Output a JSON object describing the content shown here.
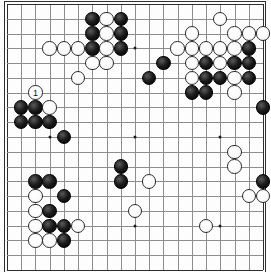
{
  "board": {
    "size": 19,
    "origin_x": 7,
    "origin_y": 4,
    "spacing_x": 14.22,
    "spacing_y": 14.78,
    "stone_radius": 7.2,
    "line_color": "#8d8d8d",
    "edge_color": "#2e2e2e",
    "background_color": "#fdfdfd",
    "black_color": "#000000",
    "white_color": "#ffffff",
    "star_points": [
      [
        4,
        4
      ],
      [
        10,
        4
      ],
      [
        16,
        4
      ],
      [
        4,
        10
      ],
      [
        10,
        10
      ],
      [
        16,
        10
      ],
      [
        4,
        16
      ],
      [
        10,
        16
      ],
      [
        16,
        16
      ]
    ],
    "visible_columns": [
      1,
      19
    ],
    "visible_rows": [
      1,
      19
    ]
  },
  "move_markers": [
    {
      "number": "1",
      "col": 3,
      "row": 7,
      "color": "white"
    }
  ],
  "stones": [
    {
      "col": 7,
      "row": 2,
      "color": "black"
    },
    {
      "col": 8,
      "row": 2,
      "color": "white"
    },
    {
      "col": 9,
      "row": 2,
      "color": "black"
    },
    {
      "col": 16,
      "row": 2,
      "color": "white"
    },
    {
      "col": 7,
      "row": 3,
      "color": "black"
    },
    {
      "col": 8,
      "row": 3,
      "color": "white"
    },
    {
      "col": 9,
      "row": 3,
      "color": "black"
    },
    {
      "col": 14,
      "row": 3,
      "color": "white"
    },
    {
      "col": 17,
      "row": 3,
      "color": "white"
    },
    {
      "col": 18,
      "row": 3,
      "color": "white"
    },
    {
      "col": 19,
      "row": 3,
      "color": "white"
    },
    {
      "col": 4,
      "row": 4,
      "color": "white"
    },
    {
      "col": 5,
      "row": 4,
      "color": "white"
    },
    {
      "col": 6,
      "row": 4,
      "color": "white"
    },
    {
      "col": 7,
      "row": 4,
      "color": "black"
    },
    {
      "col": 8,
      "row": 4,
      "color": "white"
    },
    {
      "col": 9,
      "row": 4,
      "color": "black"
    },
    {
      "col": 13,
      "row": 4,
      "color": "white"
    },
    {
      "col": 14,
      "row": 4,
      "color": "white"
    },
    {
      "col": 15,
      "row": 4,
      "color": "white"
    },
    {
      "col": 16,
      "row": 4,
      "color": "white"
    },
    {
      "col": 17,
      "row": 4,
      "color": "white"
    },
    {
      "col": 18,
      "row": 4,
      "color": "black"
    },
    {
      "col": 7,
      "row": 5,
      "color": "white"
    },
    {
      "col": 8,
      "row": 5,
      "color": "white"
    },
    {
      "col": 12,
      "row": 5,
      "color": "black"
    },
    {
      "col": 14,
      "row": 5,
      "color": "white"
    },
    {
      "col": 15,
      "row": 5,
      "color": "black"
    },
    {
      "col": 16,
      "row": 5,
      "color": "white"
    },
    {
      "col": 17,
      "row": 5,
      "color": "black"
    },
    {
      "col": 18,
      "row": 5,
      "color": "black"
    },
    {
      "col": 14,
      "row": 6,
      "color": "white"
    },
    {
      "col": 15,
      "row": 6,
      "color": "black"
    },
    {
      "col": 16,
      "row": 6,
      "color": "black"
    },
    {
      "col": 17,
      "row": 6,
      "color": "white"
    },
    {
      "col": 18,
      "row": 6,
      "color": "black"
    },
    {
      "col": 6,
      "row": 6,
      "color": "white"
    },
    {
      "col": 11,
      "row": 6,
      "color": "black"
    },
    {
      "col": 3,
      "row": 7,
      "color": "white"
    },
    {
      "col": 14,
      "row": 7,
      "color": "black"
    },
    {
      "col": 15,
      "row": 7,
      "color": "black"
    },
    {
      "col": 17,
      "row": 7,
      "color": "white"
    },
    {
      "col": 2,
      "row": 8,
      "color": "black"
    },
    {
      "col": 3,
      "row": 8,
      "color": "black"
    },
    {
      "col": 4,
      "row": 8,
      "color": "white"
    },
    {
      "col": 19,
      "row": 8,
      "color": "black"
    },
    {
      "col": 2,
      "row": 9,
      "color": "black"
    },
    {
      "col": 3,
      "row": 9,
      "color": "black"
    },
    {
      "col": 4,
      "row": 9,
      "color": "black"
    },
    {
      "col": 5,
      "row": 10,
      "color": "black"
    },
    {
      "col": 17,
      "row": 11,
      "color": "white"
    },
    {
      "col": 9,
      "row": 12,
      "color": "black"
    },
    {
      "col": 17,
      "row": 12,
      "color": "white"
    },
    {
      "col": 3,
      "row": 13,
      "color": "black"
    },
    {
      "col": 4,
      "row": 13,
      "color": "black"
    },
    {
      "col": 9,
      "row": 13,
      "color": "black"
    },
    {
      "col": 11,
      "row": 13,
      "color": "white"
    },
    {
      "col": 19,
      "row": 13,
      "color": "black"
    },
    {
      "col": 3,
      "row": 14,
      "color": "white"
    },
    {
      "col": 5,
      "row": 14,
      "color": "black"
    },
    {
      "col": 18,
      "row": 14,
      "color": "white"
    },
    {
      "col": 19,
      "row": 14,
      "color": "white"
    },
    {
      "col": 3,
      "row": 15,
      "color": "white"
    },
    {
      "col": 4,
      "row": 15,
      "color": "black"
    },
    {
      "col": 10,
      "row": 15,
      "color": "white"
    },
    {
      "col": 3,
      "row": 16,
      "color": "white"
    },
    {
      "col": 4,
      "row": 16,
      "color": "black"
    },
    {
      "col": 5,
      "row": 16,
      "color": "black"
    },
    {
      "col": 6,
      "row": 16,
      "color": "white"
    },
    {
      "col": 15,
      "row": 16,
      "color": "white"
    },
    {
      "col": 3,
      "row": 17,
      "color": "white"
    },
    {
      "col": 4,
      "row": 17,
      "color": "white"
    },
    {
      "col": 5,
      "row": 17,
      "color": "black"
    }
  ]
}
